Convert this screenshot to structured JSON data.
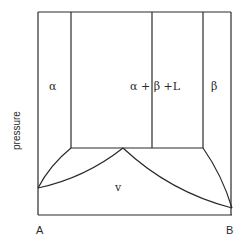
{
  "diagram": {
    "type": "phase-diagram",
    "axis": {
      "y_label": "pressure",
      "x_left_label": "A",
      "x_right_label": "B"
    },
    "regions": [
      {
        "id": "alpha",
        "label": "α"
      },
      {
        "id": "alpha-beta-liquid",
        "label": "α + β +L"
      },
      {
        "id": "beta",
        "label": "β"
      },
      {
        "id": "vapor",
        "label": "v"
      }
    ],
    "colors": {
      "line": "#2a2a2a",
      "background": "#ffffff"
    }
  }
}
